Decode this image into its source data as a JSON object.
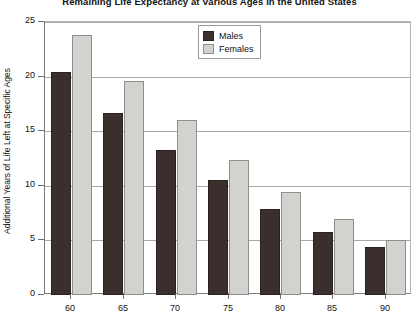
{
  "chart_data": {
    "type": "bar",
    "title": "Remaining Life Expectancy at Various Ages in the United States",
    "xlabel": "",
    "ylabel": "Additional Years of Life Left at Specific Ages",
    "categories": [
      "60",
      "65",
      "70",
      "75",
      "80",
      "85",
      "90"
    ],
    "series": [
      {
        "name": "Males",
        "color": "#3a2f2d",
        "values": [
          20.4,
          16.7,
          13.3,
          10.5,
          7.9,
          5.8,
          4.4
        ]
      },
      {
        "name": "Females",
        "color": "#d2d2ce",
        "values": [
          23.8,
          19.6,
          16.0,
          12.4,
          9.4,
          7.0,
          5.0
        ]
      }
    ],
    "ylim": [
      0,
      25
    ],
    "yticks": [
      0,
      5,
      10,
      15,
      20,
      25
    ],
    "ytick_labels": [
      "0",
      "5",
      "10",
      "15",
      "20",
      "25"
    ],
    "grid": true,
    "legend_position": "top-center"
  },
  "legend": {
    "items": [
      {
        "label": "Males"
      },
      {
        "label": "Females"
      }
    ]
  }
}
